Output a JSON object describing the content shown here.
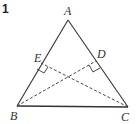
{
  "problem_number": "1",
  "points": {
    "A": {
      "label": "A",
      "x": 68,
      "y": 20
    },
    "B": {
      "label": "B",
      "x": 17,
      "y": 106
    },
    "C": {
      "label": "C",
      "x": 128,
      "y": 107
    },
    "D": {
      "label": "D",
      "x": 96,
      "y": 61
    },
    "E": {
      "label": "E",
      "x": 41,
      "y": 63
    }
  },
  "segments": [
    {
      "from": "A",
      "to": "B",
      "style": "solid"
    },
    {
      "from": "A",
      "to": "C",
      "style": "solid"
    },
    {
      "from": "B",
      "to": "C",
      "style": "solid"
    },
    {
      "from": "B",
      "to": "D",
      "style": "dashed"
    },
    {
      "from": "C",
      "to": "E",
      "style": "dashed"
    }
  ],
  "right_angles": [
    "E",
    "D"
  ],
  "colors": {
    "line": "#333333",
    "background": "#ffffff"
  }
}
